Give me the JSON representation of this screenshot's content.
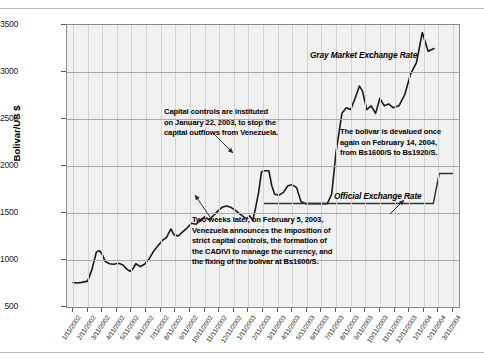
{
  "chart_data": {
    "type": "line",
    "title": "",
    "xlabel": "",
    "ylabel": "Bolivar/US $",
    "ylim": [
      500,
      3500
    ],
    "yticks": [
      500,
      1000,
      1500,
      2000,
      2500,
      3000,
      3500
    ],
    "grid": true,
    "legend_position": "inline-annotation",
    "categories": [
      "1/11/2002",
      "2/11/2002",
      "3/11/2002",
      "4/11/2002",
      "5/11/2002",
      "6/11/2002",
      "7/11/2002",
      "8/11/2002",
      "9/11/2002",
      "10/11/2002",
      "11/11/2002",
      "12/11/2002",
      "1/11/2003",
      "2/11/2003",
      "3/11/2003",
      "4/11/2003",
      "5/11/2003",
      "6/11/2003",
      "7/11/2003",
      "8/11/2003",
      "9/11/2003",
      "10/11/2003",
      "11/11/2003",
      "12/11/2003",
      "1/11/2004",
      "2/11/2004",
      "3/11/2004"
    ],
    "series": [
      {
        "name": "Gray Market Exchange Rate",
        "color": "#1a1a1a",
        "values": [
          760,
          770,
          1100,
          960,
          940,
          900,
          880,
          1000,
          1120,
          1190,
          1250,
          1370,
          1580,
          1720,
          1680,
          1700,
          1640,
          1560,
          1950,
          1700,
          1780,
          1600,
          2600,
          2850,
          2600,
          2700,
          3250
        ],
        "detail_points": [
          [
            0,
            760
          ],
          [
            0.3,
            755
          ],
          [
            0.6,
            762
          ],
          [
            1.0,
            775
          ],
          [
            1.3,
            900
          ],
          [
            1.6,
            1085
          ],
          [
            1.8,
            1100
          ],
          [
            2.0,
            1060
          ],
          [
            2.2,
            985
          ],
          [
            2.5,
            960
          ],
          [
            2.8,
            955
          ],
          [
            3.1,
            965
          ],
          [
            3.4,
            950
          ],
          [
            3.7,
            900
          ],
          [
            3.9,
            880
          ],
          [
            4.1,
            905
          ],
          [
            4.3,
            960
          ],
          [
            4.6,
            930
          ],
          [
            4.9,
            955
          ],
          [
            5.2,
            1010
          ],
          [
            5.5,
            1090
          ],
          [
            5.8,
            1150
          ],
          [
            6.1,
            1205
          ],
          [
            6.4,
            1240
          ],
          [
            6.7,
            1330
          ],
          [
            6.9,
            1270
          ],
          [
            7.2,
            1255
          ],
          [
            7.5,
            1300
          ],
          [
            7.8,
            1340
          ],
          [
            8.1,
            1390
          ],
          [
            8.4,
            1380
          ],
          [
            8.7,
            1420
          ],
          [
            9.0,
            1460
          ],
          [
            9.3,
            1430
          ],
          [
            9.6,
            1470
          ],
          [
            9.9,
            1520
          ],
          [
            10.2,
            1560
          ],
          [
            10.5,
            1575
          ],
          [
            10.8,
            1560
          ],
          [
            11.1,
            1530
          ],
          [
            11.4,
            1490
          ],
          [
            11.7,
            1455
          ],
          [
            11.9,
            1440
          ],
          [
            12.1,
            1470
          ],
          [
            12.3,
            1420
          ],
          [
            12.5,
            1560
          ],
          [
            12.7,
            1720
          ],
          [
            12.9,
            1940
          ],
          [
            13.1,
            1950
          ],
          [
            13.4,
            1950
          ],
          [
            13.6,
            1790
          ],
          [
            13.8,
            1700
          ],
          [
            14.1,
            1690
          ],
          [
            14.4,
            1720
          ],
          [
            14.7,
            1790
          ],
          [
            15.0,
            1800
          ],
          [
            15.3,
            1770
          ],
          [
            15.6,
            1620
          ],
          [
            15.9,
            1600
          ],
          [
            16.5,
            1600
          ],
          [
            17.4,
            1600
          ],
          [
            17.7,
            1700
          ],
          [
            18.0,
            2150
          ],
          [
            18.4,
            2560
          ],
          [
            18.7,
            2620
          ],
          [
            19.0,
            2600
          ],
          [
            19.3,
            2720
          ],
          [
            19.6,
            2850
          ],
          [
            19.8,
            2800
          ],
          [
            20.1,
            2600
          ],
          [
            20.4,
            2640
          ],
          [
            20.7,
            2560
          ],
          [
            21.0,
            2720
          ],
          [
            21.3,
            2640
          ],
          [
            21.6,
            2660
          ],
          [
            21.9,
            2620
          ],
          [
            22.3,
            2640
          ],
          [
            22.7,
            2760
          ],
          [
            23.1,
            2980
          ],
          [
            23.5,
            3100
          ],
          [
            23.9,
            3420
          ],
          [
            24.3,
            3220
          ],
          [
            24.7,
            3250
          ]
        ]
      },
      {
        "name": "Official Exchange Rate",
        "color": "#333333",
        "values": [
          null,
          null,
          null,
          null,
          null,
          null,
          null,
          null,
          null,
          null,
          null,
          null,
          null,
          1600,
          1600,
          1600,
          1600,
          1600,
          1600,
          1600,
          1600,
          1600,
          1600,
          1600,
          1600,
          1920,
          1920
        ],
        "step_from": 1600,
        "step_to": 1920,
        "step_date": "2/14/2004"
      }
    ],
    "annotations": [
      {
        "id": "capital-controls",
        "text": "Capital controls are instituted on January 22, 2003, to stop the capital outflows from Venezuela.",
        "lines": [
          "Capital controls are instituted",
          "on January 22, 2003, to stop the",
          "capital outflows from Venezuela."
        ]
      },
      {
        "id": "cadivi",
        "text": "Two weeks later, on February 5, 2003, Venezuela announces the imposition of strict capital controls, the formation of the CADIVI to manage the currency, and the fixing of the bolivar at Bs1600/S.",
        "lines": [
          "Two weeks later, on February 5, 2003,",
          "Venezuela announces the imposition of",
          "strict capital controls, the formation of",
          "the CADIVI to manage the currency, and",
          "the fixing of the bolivar at Bs1600/S."
        ]
      },
      {
        "id": "devaluation",
        "text": "The bolivar is devalued once again on February 14, 2004, from Bs1600/S to Bs1920/S.",
        "lines": [
          "The bolivar is devalued once",
          "again on February 14, 2004,",
          "from Bs1600/S to Bs1920/S."
        ]
      }
    ],
    "series_labels": {
      "gray_market": "Gray Market Exchange Rate",
      "official": "Official Exchange Rate"
    }
  }
}
